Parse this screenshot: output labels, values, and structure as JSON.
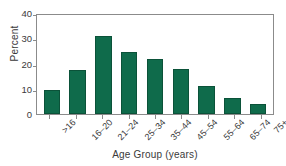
{
  "chart_data": {
    "type": "bar",
    "title": "",
    "subtitle": "",
    "xlabel": "Age Group (years)",
    "ylabel": "Percent",
    "categories": [
      ">16",
      "16–20",
      "21–24",
      "25–34",
      "35–44",
      "45–54",
      "55–64",
      "65–74",
      "75+"
    ],
    "values": [
      9.8,
      17.8,
      31.5,
      25.0,
      22.3,
      18.0,
      11.5,
      6.5,
      4.0
    ],
    "ylim": [
      0,
      40
    ],
    "yticks": [
      0,
      10,
      20,
      30,
      40
    ],
    "ytick_labels": [
      "0",
      "10",
      "20",
      "30",
      "40"
    ],
    "grid": false,
    "legend": "none",
    "bar_color": "#0f6b4b",
    "bar_edge_color": "#0b5239",
    "axis_color": "#8b8b8b",
    "background_color": "#ffffff",
    "text_color": "#3a3a3a"
  }
}
